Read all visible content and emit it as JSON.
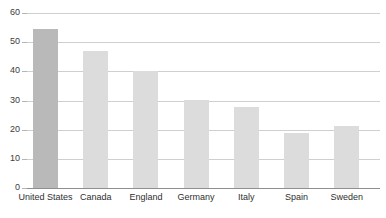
{
  "chart_data": {
    "type": "bar",
    "title": "",
    "title_clipped": true,
    "xlabel": "",
    "ylabel": "",
    "categories": [
      "United States",
      "Canada",
      "England",
      "Germany",
      "Italy",
      "Spain",
      "Sweden"
    ],
    "values": [
      54.5,
      47,
      40.2,
      30.2,
      27.8,
      18.9,
      21.3
    ],
    "ylim": [
      0,
      60
    ],
    "yticks": [
      0,
      10,
      20,
      30,
      40,
      50,
      60
    ],
    "ytick_labels": [
      "0",
      "10",
      "20",
      "30",
      "40",
      "50",
      "60"
    ],
    "grid": true,
    "grid_axis": "y",
    "legend": null,
    "bar_colors": [
      "#b9b9b9",
      "#dcdcdc",
      "#dcdcdc",
      "#dcdcdc",
      "#dcdcdc",
      "#dcdcdc",
      "#dcdcdc"
    ],
    "highlight_index": 0
  },
  "style": {
    "background": "#ffffff",
    "gridline_color": "#cfcfcf",
    "axis_color": "#8f8f8f",
    "tick_color": "#b4b4b4",
    "bar_default": "#dcdcdc",
    "bar_highlight": "#b9b9b9",
    "label_color": "#2f2f2f"
  }
}
